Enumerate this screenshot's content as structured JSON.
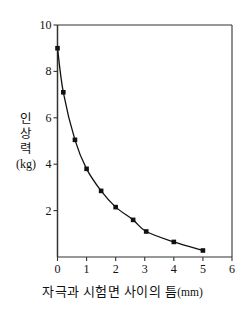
{
  "chart_data": {
    "type": "line",
    "title": "",
    "subtitle": "",
    "xlabel": "자극과 시험면 사이의 틈(mm)",
    "xlabel_main": "자극과 시험면 사이의 틈",
    "xlabel_unit": "(mm)",
    "ylabel": "인상력 (kg)",
    "ylabel_chars": [
      "인",
      "상",
      "력"
    ],
    "ylabel_unit": "(kg)",
    "xlim": [
      0,
      6
    ],
    "ylim": [
      0,
      10
    ],
    "xticks": [
      0,
      1,
      2,
      3,
      4,
      5,
      6
    ],
    "xtick_labels": [
      "0",
      "1",
      "2",
      "3",
      "4",
      "5",
      "6"
    ],
    "yticks": [
      2,
      4,
      6,
      8,
      10
    ],
    "ytick_labels": [
      "2",
      "4",
      "6",
      "8",
      "10"
    ],
    "grid": false,
    "legend": null,
    "marker": "filled-square",
    "line_color": "#111111",
    "marker_color": "#111111",
    "axis_color": "#333333",
    "background": "#ffffff",
    "x": [
      0,
      0.2,
      0.6,
      1.0,
      1.5,
      2.0,
      2.6,
      3.05,
      4.0,
      5.0
    ],
    "values": [
      9.0,
      7.1,
      5.05,
      3.8,
      2.85,
      2.15,
      1.6,
      1.1,
      0.65,
      0.28
    ],
    "series": [
      {
        "name": "인상력",
        "x": [
          0,
          0.2,
          0.6,
          1.0,
          1.5,
          2.0,
          2.6,
          3.05,
          4.0,
          5.0
        ],
        "values": [
          9.0,
          7.1,
          5.05,
          3.8,
          2.85,
          2.15,
          1.6,
          1.1,
          0.65,
          0.28
        ]
      }
    ]
  }
}
